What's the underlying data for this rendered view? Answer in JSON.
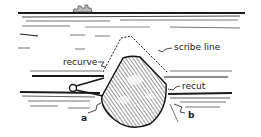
{
  "diagram": {
    "labels": {
      "scribe_line": "scribe line",
      "recurve": "recurve",
      "recut": "recut",
      "a": "a",
      "b": "b"
    },
    "colors": {
      "ink": "#1a1a1a",
      "background": "#ffffff"
    }
  }
}
